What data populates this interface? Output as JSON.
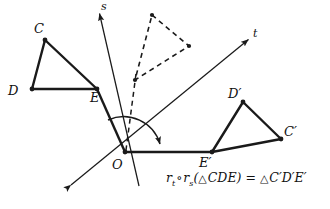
{
  "figure": {
    "background_color": "#ffffff",
    "stroke_color": "#1a1a1a",
    "equation": {
      "r_symbol": "r",
      "sub_t": "t",
      "sub_s": "s",
      "compose_op": "∘",
      "open_paren": "(",
      "triangle_symbol": "△",
      "preimage": "CDE",
      "close_paren": ")",
      "equals": "=",
      "image": "C′D′E′",
      "plain": "r_t ∘ r_s(△CDE) = △C′D′E′"
    },
    "labels": {
      "C": "C",
      "D": "D",
      "E": "E",
      "O": "O",
      "s": "s",
      "t": "t",
      "Cp": "C′",
      "Dp": "D′",
      "Ep": "E′"
    },
    "points": {
      "C": [
        45,
        40
      ],
      "D": [
        32,
        89
      ],
      "E": [
        97,
        89
      ],
      "O": [
        125,
        152
      ],
      "Cp": [
        281,
        139
      ],
      "Dp": [
        243,
        102
      ],
      "Ep": [
        212,
        152
      ],
      "M1": [
        152,
        15
      ],
      "M2": [
        189,
        46
      ],
      "M3": [
        135,
        80
      ]
    },
    "label_positions": {
      "C": [
        36,
        28
      ],
      "D": [
        10,
        92
      ],
      "E": [
        94,
        97
      ],
      "O": [
        113,
        168
      ],
      "s": [
        102,
        10
      ],
      "t": [
        254,
        37
      ],
      "Cp": [
        286,
        133
      ],
      "Dp": [
        231,
        96
      ],
      "Ep": [
        202,
        165
      ]
    },
    "lines": {
      "s_line": {
        "from": [
          98,
          12
        ],
        "to": [
          139,
          185
        ],
        "arrow_at": "from",
        "style": "solid"
      },
      "t_line": {
        "from": [
          70,
          186
        ],
        "to": [
          250,
          38
        ],
        "arrow_at": "both",
        "style": "solid"
      },
      "horizontal_ray": {
        "from": [
          125,
          152
        ],
        "to": [
          214,
          152
        ],
        "style": "solid-thick"
      },
      "dashed_vertical": {
        "from": [
          135,
          80
        ],
        "to": [
          125,
          152
        ],
        "style": "dashed"
      },
      "rotation_arc": {
        "center": [
          125,
          152
        ],
        "radius": 36,
        "start_deg": 118,
        "end_deg": 2
      }
    },
    "triangles": {
      "preimage": {
        "name": "CDE",
        "style": "solid",
        "vertices": [
          "C",
          "D",
          "E"
        ]
      },
      "intermediate": {
        "name": "mid",
        "style": "dashed",
        "vertices": [
          "M1",
          "M2",
          "M3"
        ]
      },
      "image": {
        "name": "C′D′E′",
        "style": "solid",
        "vertices": [
          "Cp",
          "Dp",
          "Ep"
        ]
      }
    }
  }
}
